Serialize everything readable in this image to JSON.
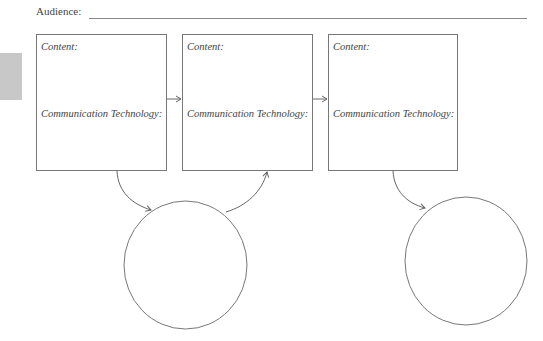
{
  "header": {
    "audience_label": "Audience:",
    "audience_value": ""
  },
  "boxes": [
    {
      "content_label": "Content:",
      "tech_label": "Communication Technology:"
    },
    {
      "content_label": "Content:",
      "tech_label": "Communication Technology:"
    },
    {
      "content_label": "Content:",
      "tech_label": "Communication Technology:"
    }
  ],
  "circles": [
    {
      "label": ""
    },
    {
      "label": ""
    }
  ],
  "colors": {
    "stroke": "#777777",
    "tab": "#c8c8c8"
  }
}
